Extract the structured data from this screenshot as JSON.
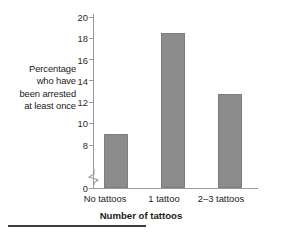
{
  "chart_data": {
    "type": "bar",
    "title": "",
    "categories": [
      "No tattoos",
      "1 tattoo",
      "2–3 tattoos"
    ],
    "values": [
      9.0,
      18.5,
      12.8
    ],
    "xlabel": "Number of tattoos",
    "ylabel": "Percentage who have been arrested at least once",
    "ylabel_lines": [
      "Percentage",
      "who have",
      "been arrested",
      "at least once"
    ],
    "ylim": [
      0,
      20
    ],
    "yticks": [
      0,
      8,
      10,
      12,
      14,
      16,
      18,
      20
    ],
    "ytick_labels": [
      "0",
      "8",
      "10",
      "12",
      "14",
      "16",
      "18",
      "20"
    ],
    "y_axis_break": true,
    "y_axis_break_between": [
      0,
      8
    ],
    "grid": false,
    "legend": false,
    "bar_color": "#8c8c8c",
    "axis_color": "#9a9a9a",
    "text_color": "#1a1a1a"
  },
  "axis": {
    "y_label_lines": {
      "line1": "Percentage",
      "line2": "who have",
      "line3": "been arrested",
      "line4": "at least once"
    },
    "y_ticks": {
      "t20": "20",
      "t18": "18",
      "t16": "16",
      "t14": "14",
      "t12": "12",
      "t10": "10",
      "t8": "8",
      "t0": "0"
    },
    "x_ticks": {
      "c1": "No tattoos",
      "c2": "1 tattoo",
      "c3": "2–3 tattoos"
    },
    "x_title": "Number of tattoos"
  }
}
